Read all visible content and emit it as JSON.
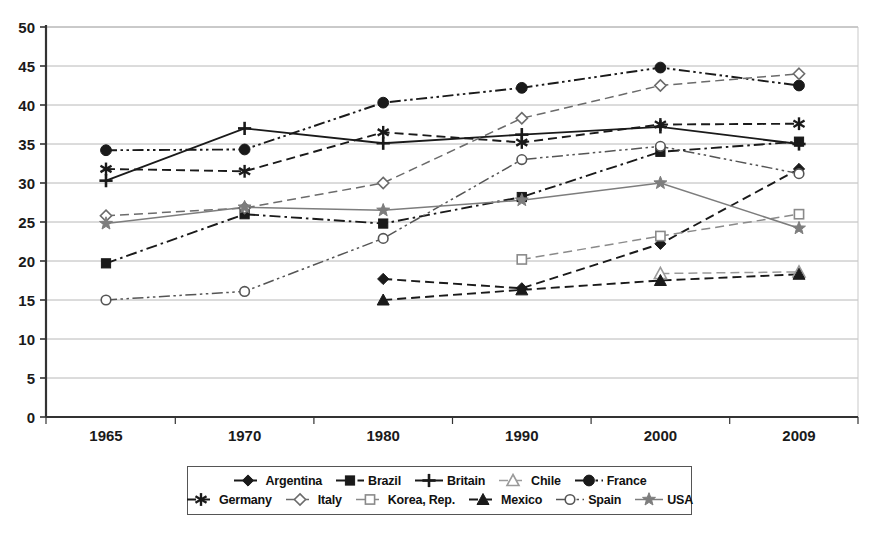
{
  "chart_data": {
    "type": "line",
    "title": "",
    "subtitle": "",
    "xlabel": "",
    "ylabel": "",
    "categories": [
      "1965",
      "1970",
      "1980",
      "1990",
      "2000",
      "2009"
    ],
    "ylim": [
      0,
      50
    ],
    "ytick_step": 5,
    "yticks": [
      "0",
      "5",
      "10",
      "15",
      "20",
      "25",
      "30",
      "35",
      "40",
      "45",
      "50"
    ],
    "grid": "horizontal",
    "legend_position": "bottom",
    "series": [
      {
        "name": "Argentina",
        "marker": "filled-diamond",
        "line": "dashed",
        "color": "#1a1a1a",
        "values": [
          null,
          null,
          17.7,
          16.5,
          22.2,
          31.8
        ]
      },
      {
        "name": "Brazil",
        "marker": "filled-square",
        "line": "dash-dot",
        "color": "#1a1a1a",
        "values": [
          19.7,
          26.0,
          24.8,
          28.2,
          34.0,
          35.3
        ]
      },
      {
        "name": "Britain",
        "marker": "plus",
        "line": "solid",
        "color": "#1a1a1a",
        "values": [
          30.3,
          37.0,
          35.1,
          36.2,
          37.2,
          35.0
        ]
      },
      {
        "name": "Chile",
        "marker": "open-triangle",
        "line": "dashed",
        "color": "#9a9a9a",
        "values": [
          null,
          null,
          null,
          null,
          18.4,
          18.6
        ]
      },
      {
        "name": "France",
        "marker": "filled-circle",
        "line": "dash-dot-dot",
        "color": "#1a1a1a",
        "values": [
          34.2,
          34.3,
          40.3,
          42.2,
          44.8,
          42.5
        ]
      },
      {
        "name": "Germany",
        "marker": "asterisk",
        "line": "dashed",
        "color": "#1a1a1a",
        "values": [
          31.8,
          31.5,
          36.5,
          35.2,
          37.5,
          37.6
        ]
      },
      {
        "name": "Italy",
        "marker": "open-diamond",
        "line": "dashed",
        "color": "#6b6b6b",
        "values": [
          25.8,
          26.8,
          30.0,
          38.3,
          42.5,
          44.0
        ]
      },
      {
        "name": "Korea, Rep.",
        "marker": "open-square",
        "line": "dashed",
        "color": "#8a8a8a",
        "values": [
          null,
          null,
          null,
          20.2,
          23.2,
          26.0
        ]
      },
      {
        "name": "Mexico",
        "marker": "filled-triangle",
        "line": "dashed",
        "color": "#1a1a1a",
        "values": [
          null,
          null,
          15.0,
          16.3,
          17.5,
          18.3
        ]
      },
      {
        "name": "Spain",
        "marker": "open-circle",
        "line": "dash-dot-dot",
        "color": "#555555",
        "values": [
          15.0,
          16.1,
          22.9,
          33.0,
          34.7,
          31.2
        ]
      },
      {
        "name": "USA",
        "marker": "star",
        "line": "solid",
        "color": "#7d7d7d",
        "values": [
          24.8,
          26.9,
          26.5,
          27.8,
          30.0,
          24.2
        ]
      }
    ]
  },
  "legend": {
    "row1": [
      {
        "label": "Argentina",
        "series": 0
      },
      {
        "label": "Brazil",
        "series": 1
      },
      {
        "label": "Britain",
        "series": 2
      },
      {
        "label": "Chile",
        "series": 3
      },
      {
        "label": "France",
        "series": 4
      }
    ],
    "row2": [
      {
        "label": "Germany",
        "series": 5
      },
      {
        "label": "Italy",
        "series": 6
      },
      {
        "label": "Korea, Rep.",
        "series": 7
      },
      {
        "label": "Mexico",
        "series": 8
      },
      {
        "label": "Spain",
        "series": 9
      },
      {
        "label": "USA",
        "series": 10
      }
    ]
  },
  "axes": {
    "y_tick_labels": [
      "50",
      "45",
      "40",
      "35",
      "30",
      "25",
      "20",
      "15",
      "10",
      "5",
      "0"
    ],
    "x_tick_labels": [
      "1965",
      "1970",
      "1980",
      "1990",
      "2000",
      "2009"
    ]
  },
  "colors": {
    "axis": "#333333",
    "grid": "#b8b8b8",
    "plot_background": "#ffffff",
    "text": "#1a1a1a"
  }
}
